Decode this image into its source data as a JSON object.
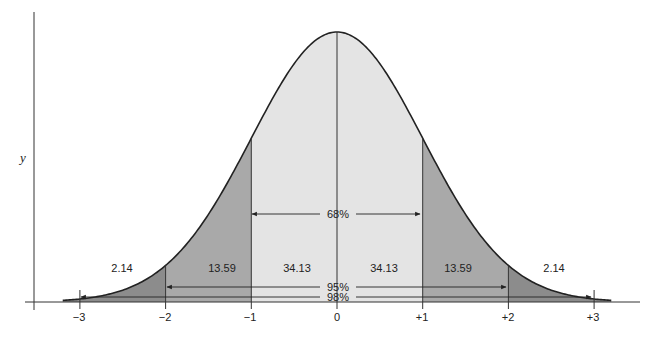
{
  "chart_data": {
    "type": "area",
    "title": "",
    "xlabel": "",
    "ylabel": "y",
    "distribution": "normal",
    "x_ticks": [
      "−3",
      "−2",
      "−1",
      "0",
      "+1",
      "+2",
      "+3"
    ],
    "x_tick_values": [
      -3,
      -2,
      -1,
      0,
      1,
      2,
      3
    ],
    "regions": [
      {
        "range": [
          -3,
          -2
        ],
        "percent": "2.14"
      },
      {
        "range": [
          -2,
          -1
        ],
        "percent": "13.59"
      },
      {
        "range": [
          -1,
          0
        ],
        "percent": "34.13"
      },
      {
        "range": [
          0,
          1
        ],
        "percent": "34.13"
      },
      {
        "range": [
          1,
          2
        ],
        "percent": "13.59"
      },
      {
        "range": [
          2,
          3
        ],
        "percent": "2.14"
      }
    ],
    "intervals": [
      {
        "range": [
          -1,
          1
        ],
        "label": "68%"
      },
      {
        "range": [
          -2,
          2
        ],
        "label": "95%"
      },
      {
        "range": [
          -3,
          3
        ],
        "label": "98%"
      }
    ],
    "grid": false
  },
  "labels": {
    "y_axis": "y",
    "r1": "2.14",
    "r2": "13.59",
    "r3": "34.13",
    "r4": "34.13",
    "r5": "13.59",
    "r6": "2.14",
    "i68": "68%",
    "i95": "95%",
    "i98": "98%",
    "t0": "−3",
    "t1": "−2",
    "t2": "−1",
    "t3": "0",
    "t4": "+1",
    "t5": "+2",
    "t6": "+3"
  },
  "colors": {
    "inner": "#e4e4e4",
    "middle": "#a9a9a9",
    "outer": "#8c8c8c",
    "line": "#222222"
  }
}
